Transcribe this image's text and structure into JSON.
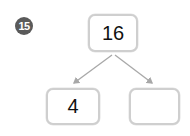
{
  "problem": {
    "number": "15"
  },
  "tree": {
    "root": {
      "value": "16"
    },
    "children": [
      {
        "value": "4"
      },
      {
        "value": ""
      }
    ]
  },
  "colors": {
    "box_border": "#cfcfcf",
    "arrow": "#a8a8a8",
    "badge": "#5a5a5a"
  }
}
